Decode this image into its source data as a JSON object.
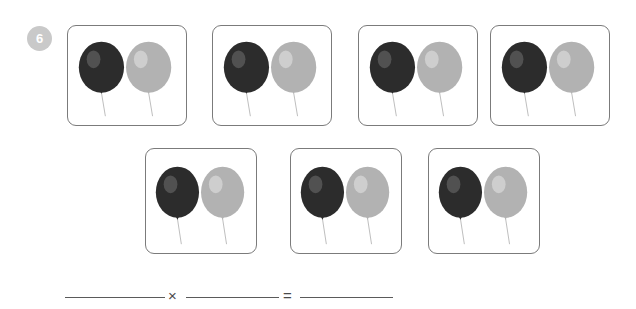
{
  "worksheet": {
    "question_number": "6",
    "task_type": "repeated-addition-to-multiplication",
    "group_count": 7,
    "items_per_group": 2,
    "rows": [
      {
        "row_index": 1,
        "groups": [
          {
            "group_index": 1,
            "balloons": [
              {
                "color_name": "dark",
                "color": "#2c2c2c",
                "highlight": "#5d5d5d"
              },
              {
                "color_name": "light-gray",
                "color": "#b2b2b2",
                "highlight": "#d4d4d4"
              }
            ]
          },
          {
            "group_index": 2,
            "balloons": [
              {
                "color_name": "dark",
                "color": "#2c2c2c",
                "highlight": "#5d5d5d"
              },
              {
                "color_name": "light-gray",
                "color": "#b2b2b2",
                "highlight": "#d4d4d4"
              }
            ]
          },
          {
            "group_index": 3,
            "balloons": [
              {
                "color_name": "dark",
                "color": "#2c2c2c",
                "highlight": "#5d5d5d"
              },
              {
                "color_name": "light-gray",
                "color": "#b2b2b2",
                "highlight": "#d4d4d4"
              }
            ]
          },
          {
            "group_index": 4,
            "balloons": [
              {
                "color_name": "dark",
                "color": "#2c2c2c",
                "highlight": "#5d5d5d"
              },
              {
                "color_name": "light-gray",
                "color": "#b2b2b2",
                "highlight": "#d4d4d4"
              }
            ]
          }
        ]
      },
      {
        "row_index": 2,
        "groups": [
          {
            "group_index": 5,
            "balloons": [
              {
                "color_name": "dark",
                "color": "#2c2c2c",
                "highlight": "#5d5d5d"
              },
              {
                "color_name": "light-gray",
                "color": "#b2b2b2",
                "highlight": "#d4d4d4"
              }
            ]
          },
          {
            "group_index": 6,
            "balloons": [
              {
                "color_name": "dark",
                "color": "#2c2c2c",
                "highlight": "#5d5d5d"
              },
              {
                "color_name": "light-gray",
                "color": "#b2b2b2",
                "highlight": "#d4d4d4"
              }
            ]
          },
          {
            "group_index": 7,
            "balloons": [
              {
                "color_name": "dark",
                "color": "#2c2c2c",
                "highlight": "#5d5d5d"
              },
              {
                "color_name": "light-gray",
                "color": "#b2b2b2",
                "highlight": "#d4d4d4"
              }
            ]
          }
        ]
      }
    ],
    "equation": {
      "factor1_value": "",
      "operator_multiply": "×",
      "factor2_value": "",
      "operator_equals": "=",
      "product_value": ""
    },
    "colors": {
      "badge_background": "#c9c9c9",
      "badge_text": "#ffffff",
      "card_border": "#7b7b7b",
      "page_background": "#ffffff",
      "rule_line": "#5a5a5a",
      "operator_text": "#4a4a4a",
      "string": "#b9b9b9"
    }
  }
}
